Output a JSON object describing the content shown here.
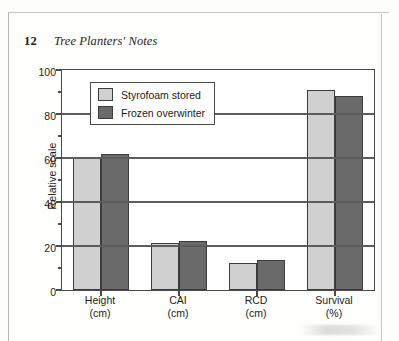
{
  "page": {
    "folio": "12",
    "running_title": "Tree Planters' Notes"
  },
  "chart_data": {
    "type": "bar",
    "title": "",
    "xlabel": "",
    "ylabel": "Relative scale",
    "ylim": [
      0,
      100
    ],
    "ytick_labels": [
      "0",
      "20",
      "40",
      "60",
      "80",
      "100"
    ],
    "ytick_values": [
      0,
      20,
      40,
      60,
      80,
      100
    ],
    "yminor_values": [
      10,
      30,
      50,
      70,
      90
    ],
    "grid": true,
    "legend_position": "upper-left-inside",
    "categories": [
      "Height\n(cm)",
      "CAI\n(cm)",
      "RCD\n(cm)",
      "Survival\n(%)"
    ],
    "category_lines": [
      {
        "line1": "Height",
        "line2": "(cm)"
      },
      {
        "line1": "CAI",
        "line2": "(cm)"
      },
      {
        "line1": "RCD",
        "line2": "(cm)"
      },
      {
        "line1": "Survival",
        "line2": "(%)"
      }
    ],
    "series": [
      {
        "name": "Styrofoam stored",
        "color": "#d0d0d0",
        "values": [
          60,
          21.5,
          12.5,
          91
        ]
      },
      {
        "name": "Frozen overwinter",
        "color": "#6a6a6a",
        "values": [
          62,
          22.5,
          13.5,
          88
        ]
      }
    ]
  }
}
